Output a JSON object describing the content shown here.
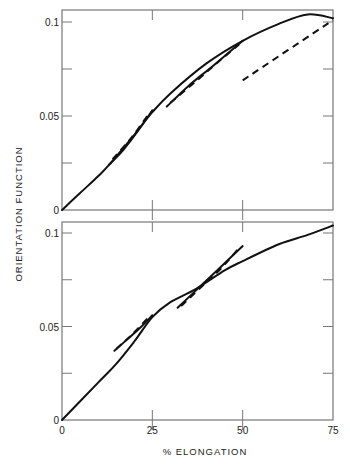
{
  "chart_data": [
    {
      "type": "line",
      "panel": "top",
      "title": "",
      "xlabel": "% ELONGATION",
      "ylabel": "ORIENTATION FUNCTION",
      "xlim": [
        0,
        75
      ],
      "ylim": [
        0,
        0.1
      ],
      "xticks": [
        0,
        25,
        50,
        75
      ],
      "yticks": [
        0,
        0.025,
        0.05,
        0.075,
        0.1
      ],
      "ytick_labels": [
        "0",
        "",
        "0.05",
        "",
        "0.1"
      ],
      "grid": false,
      "series": [
        {
          "name": "main-stretch",
          "style": "solid",
          "x": [
            0,
            5,
            10,
            13,
            20,
            25,
            30,
            40,
            50,
            60,
            68,
            75
          ],
          "y": [
            0,
            0.009,
            0.018,
            0.024,
            0.04,
            0.052,
            0.062,
            0.078,
            0.09,
            0.099,
            0.104,
            0.102
          ]
        },
        {
          "name": "loop1-return",
          "style": "solid",
          "x": [
            13,
            17,
            21,
            25
          ],
          "y": [
            0.024,
            0.032,
            0.042,
            0.053
          ]
        },
        {
          "name": "loop1-dashed",
          "style": "dashed",
          "x": [
            14,
            19,
            24
          ],
          "y": [
            0.027,
            0.038,
            0.051
          ]
        },
        {
          "name": "loop2-return",
          "style": "solid",
          "x": [
            29,
            35,
            42,
            50
          ],
          "y": [
            0.055,
            0.066,
            0.077,
            0.09
          ]
        },
        {
          "name": "loop2-dashed",
          "style": "dashed",
          "x": [
            30,
            38,
            44,
            49
          ],
          "y": [
            0.057,
            0.07,
            0.08,
            0.088
          ]
        },
        {
          "name": "final-dashed",
          "style": "dashed",
          "x": [
            50,
            75
          ],
          "y": [
            0.069,
            0.101
          ]
        }
      ]
    },
    {
      "type": "line",
      "panel": "bottom",
      "title": "",
      "xlabel": "% ELONGATION",
      "ylabel": "ORIENTATION FUNCTION",
      "xlim": [
        0,
        75
      ],
      "ylim": [
        0,
        0.1
      ],
      "xticks": [
        0,
        25,
        50,
        75
      ],
      "xtick_labels": [
        "0",
        "25",
        "50",
        "75"
      ],
      "yticks": [
        0,
        0.025,
        0.05,
        0.075,
        0.1
      ],
      "ytick_labels": [
        "0",
        "",
        "0.05",
        "",
        "0.1"
      ],
      "grid": false,
      "series": [
        {
          "name": "main-stretch",
          "style": "solid",
          "x": [
            0,
            10,
            15,
            20,
            25,
            30,
            37,
            45,
            50,
            60,
            68,
            75
          ],
          "y": [
            0,
            0.02,
            0.03,
            0.042,
            0.055,
            0.063,
            0.07,
            0.08,
            0.085,
            0.094,
            0.099,
            0.104
          ]
        },
        {
          "name": "loop1-return",
          "style": "solid",
          "x": [
            14.5,
            18,
            22,
            25
          ],
          "y": [
            0.037,
            0.043,
            0.05,
            0.056
          ]
        },
        {
          "name": "loop1-dashed",
          "style": "dashed",
          "x": [
            15,
            19,
            24
          ],
          "y": [
            0.038,
            0.045,
            0.055
          ]
        },
        {
          "name": "loop2-return",
          "style": "solid",
          "x": [
            32,
            38,
            44,
            50
          ],
          "y": [
            0.06,
            0.071,
            0.082,
            0.093
          ]
        },
        {
          "name": "loop2-dashed",
          "style": "dashed",
          "x": [
            33,
            39,
            44,
            49
          ],
          "y": [
            0.061,
            0.072,
            0.081,
            0.092
          ]
        }
      ]
    }
  ],
  "labels": {
    "xlabel": "% ELONGATION",
    "ylabel": "ORIENTATION FUNCTION"
  }
}
